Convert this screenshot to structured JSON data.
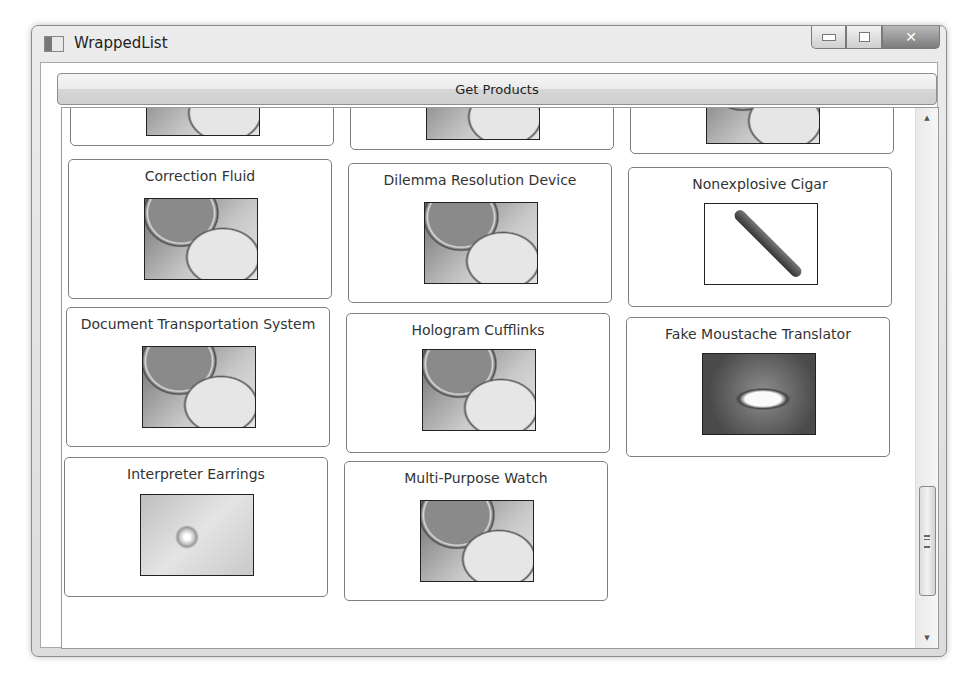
{
  "window": {
    "title": "WrappedList",
    "controls": {
      "minimize": "minimize",
      "maximize": "maximize",
      "close": "✕"
    }
  },
  "toolbar": {
    "get_products_label": "Get Products"
  },
  "products": [
    {
      "name": "",
      "image": "palette"
    },
    {
      "name": "",
      "image": "palette"
    },
    {
      "name": "",
      "image": "palette"
    },
    {
      "name": "Correction Fluid",
      "image": "palette"
    },
    {
      "name": "Dilemma Resolution Device",
      "image": "palette"
    },
    {
      "name": "Nonexplosive Cigar",
      "image": "cigar"
    },
    {
      "name": "Document Transportation System",
      "image": "palette"
    },
    {
      "name": "Hologram Cufflinks",
      "image": "palette"
    },
    {
      "name": "Fake Moustache Translator",
      "image": "face"
    },
    {
      "name": "Interpreter Earrings",
      "image": "earring"
    },
    {
      "name": "Multi-Purpose Watch",
      "image": "palette"
    }
  ],
  "scrollbar": {
    "up_arrow": "▲",
    "down_arrow": "▼"
  }
}
